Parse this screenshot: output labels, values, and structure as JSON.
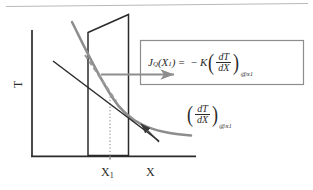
{
  "figure": {
    "title_rule": "top-divider",
    "colors": {
      "ink": "#2b2b2b",
      "curve": "#8d8d8d",
      "dashed": "#9a9a9a",
      "arrow": "#8d8d8d",
      "box_border": "#8d8d8d",
      "dotted": "#9a9a9a",
      "background": "#ffffff",
      "top_rule": "#b8b8b8"
    },
    "axes": {
      "y_label": "T",
      "x_label": "X",
      "tick_label": "X",
      "tick_label_sub": "1"
    },
    "equation_box": {
      "lhs_symbol": "J",
      "lhs_subscript": "Q",
      "lhs_arg_open": "(X",
      "lhs_arg_sub": "1",
      "lhs_arg_close": ")",
      "equals": "=",
      "minus": "−",
      "coefficient": "K",
      "numerator": "dT",
      "denominator": "dX",
      "at_symbol": "@",
      "at_variable": "x",
      "at_subscript": "1",
      "full_text": "J_Q(X_1) = -K (dT/dX)_@x_1"
    },
    "gradient_annotation": {
      "numerator": "dT",
      "denominator": "dX",
      "at_symbol": "@",
      "at_variable": "x",
      "at_subscript": "1",
      "full_text": "(dT/dX)_@x_1"
    },
    "elements": {
      "plane_name": "cross-section-plane",
      "curve_name": "temperature-profile-curve",
      "tangent_name": "tangent-line",
      "dashed_name": "dashed-construction-line",
      "flux_arrow_name": "heat-flux-arrow",
      "leader_name": "gradient-leader-arrow",
      "dotted_name": "x1-projection-line"
    }
  }
}
